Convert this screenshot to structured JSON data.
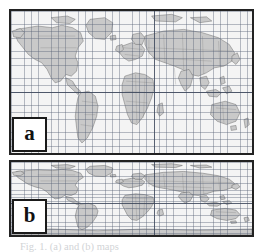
{
  "figure": {
    "caption": "Fig. 1. (a) and (b) maps",
    "background_color": "#ffffff"
  },
  "panels": [
    {
      "id": "a",
      "label": "a",
      "projection": "equirectangular",
      "border_color": "#222222",
      "ocean_color": "#f4f4f4",
      "land_color": "#c9c9c9",
      "coastline_color": "#5a5a5a",
      "border_line_color": "#6e6e6e",
      "graticule_color": "#5a6478",
      "graticule_spacing_deg": 10,
      "lat_range": [
        -85,
        85
      ],
      "lon_range": [
        -180,
        180
      ],
      "equator_shown": true,
      "central_meridian_shown": true
    },
    {
      "id": "b",
      "label": "b",
      "projection": "cylindrical-equal-area",
      "border_color": "#222222",
      "ocean_color": "#f4f4f4",
      "land_color": "#c9c9c9",
      "coastline_color": "#5a5a5a",
      "border_line_color": "#6e6e6e",
      "graticule_color": "#5a6478",
      "graticule_spacing_deg": 10,
      "lat_range": [
        -90,
        90
      ],
      "lon_range": [
        -180,
        180
      ],
      "equator_shown": true,
      "central_meridian_shown": true
    }
  ]
}
